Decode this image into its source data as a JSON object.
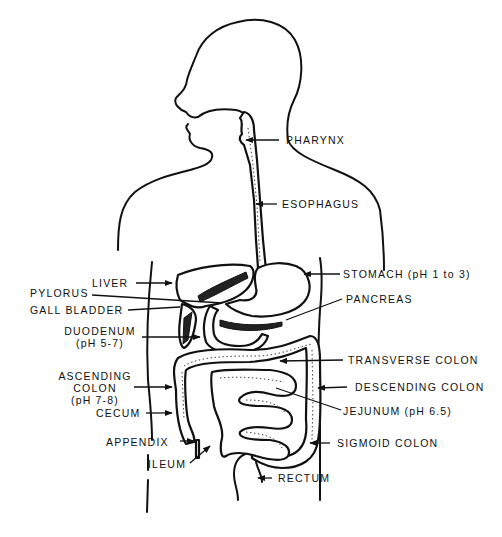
{
  "figure": {
    "colors": {
      "ink": "#111111",
      "background": "#ffffff"
    }
  },
  "labels": {
    "pharynx": "PHARYNX",
    "esophagus": "ESOPHAGUS",
    "liver": "LIVER",
    "pylorus": "PYLORUS",
    "gall_bladder": "GALL BLADDER",
    "duodenum": [
      "DUODENUM",
      "(pH 5-7)"
    ],
    "ascending_colon": [
      "ASCENDING",
      "COLON",
      "(pH 7-8)"
    ],
    "cecum": "CECUM",
    "appendix": "APPENDIX",
    "ileum": "ILEUM",
    "stomach": "STOMACH (pH 1 to 3)",
    "pancreas": "PANCREAS",
    "transverse_colon": "TRANSVERSE COLON",
    "descending_colon": "DESCENDING COLON",
    "jejunum": "JEJUNUM (pH 6.5)",
    "sigmoid_colon": "SIGMOID COLON",
    "rectum": "RECTUM"
  }
}
